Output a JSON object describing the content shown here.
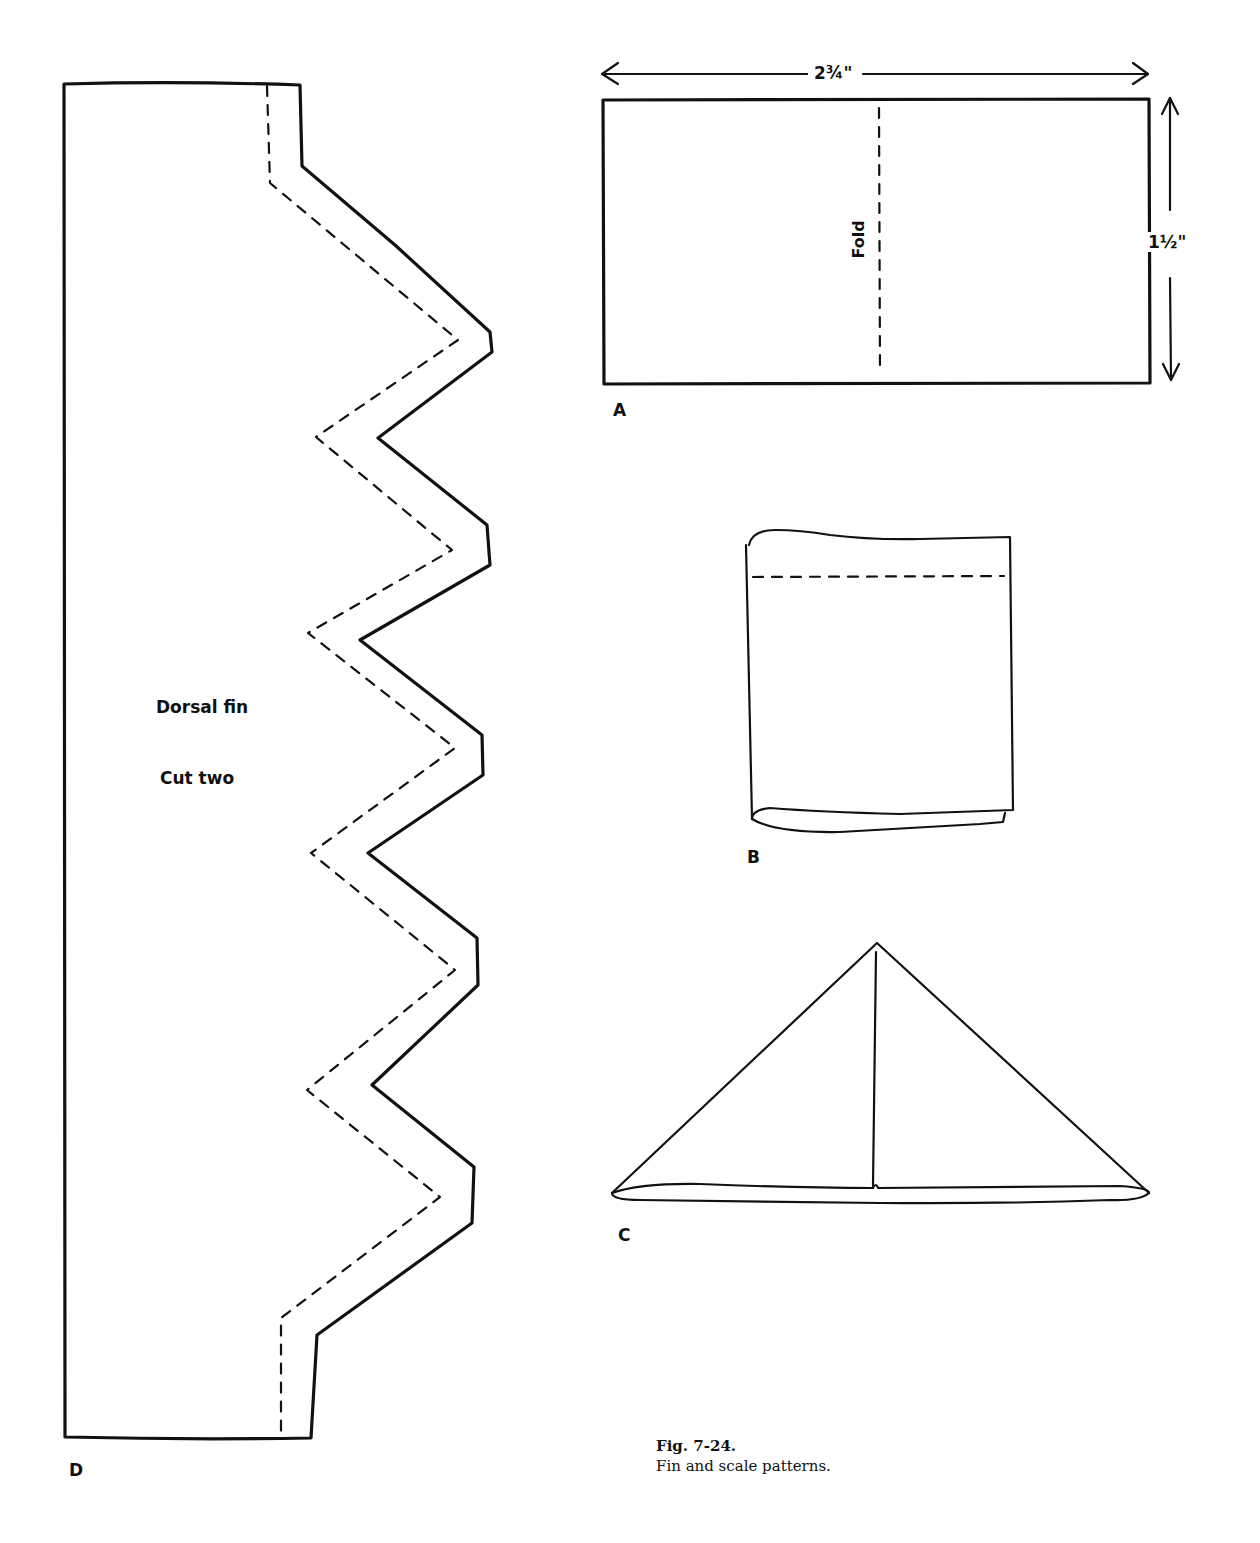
{
  "figure": {
    "number": "Fig. 7-24.",
    "caption": "Fin and scale patterns."
  },
  "panels": {
    "A": {
      "label": "A",
      "width_dimension": "2¾\"",
      "height_dimension": "1½\"",
      "fold_label": "Fold",
      "description": "Rectangle with vertical dashed fold line"
    },
    "B": {
      "label": "B",
      "description": "Rectangle folded in half with dashed stitch line near top"
    },
    "C": {
      "label": "C",
      "description": "Folded triangle scale with center seam"
    },
    "D": {
      "label": "D",
      "title": "Dorsal fin",
      "instruction": "Cut two",
      "description": "Dorsal fin pattern with zigzag edge and dashed seam allowance"
    }
  },
  "colors": {
    "ink": "#111111",
    "paper": "#ffffff"
  }
}
